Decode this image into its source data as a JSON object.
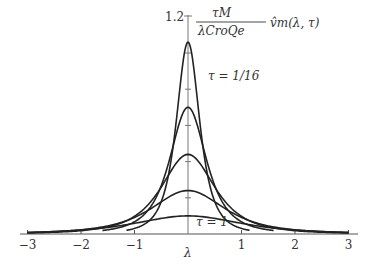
{
  "chart_data": {
    "type": "line",
    "title": "",
    "ylabel": "τ_M / (λ_C r_o Q_e) v̂_m(λ, τ)",
    "ylabel_parts": {
      "numerator": "τM",
      "denominator": "λCroQe",
      "rest": "v̂m(λ, τ)"
    },
    "xlabel": "λ",
    "xlim": [
      -3,
      3
    ],
    "ylim": [
      0,
      1.2
    ],
    "x_ticks": [
      -3,
      -2,
      -1,
      1,
      2,
      3
    ],
    "x_tick_labels": [
      "−3",
      "−2",
      "−1",
      "1",
      "2",
      "3"
    ],
    "y_ticks": [
      0.2,
      0.4,
      0.6,
      0.8,
      1.0
    ],
    "y_top_label": "1.2",
    "grid": false,
    "legend": null,
    "annotations": [
      {
        "text": "τ = 1/16",
        "x": 0.55,
        "y": 0.88
      },
      {
        "text": "τ = 1",
        "x": 0.35,
        "y": 0.06
      }
    ],
    "series": [
      {
        "name": "τ = 1/16",
        "peak": 1.06,
        "width": 0.35,
        "extent": 1.15
      },
      {
        "name": "τ = 1/8",
        "peak": 0.7,
        "width": 0.55,
        "extent": 1.6
      },
      {
        "name": "τ = 1/4",
        "peak": 0.44,
        "width": 0.8,
        "extent": 3
      },
      {
        "name": "τ = 1/2",
        "peak": 0.24,
        "width": 1.1,
        "extent": 3
      },
      {
        "name": "τ = 1",
        "peak": 0.1,
        "width": 1.6,
        "extent": 3
      }
    ]
  }
}
